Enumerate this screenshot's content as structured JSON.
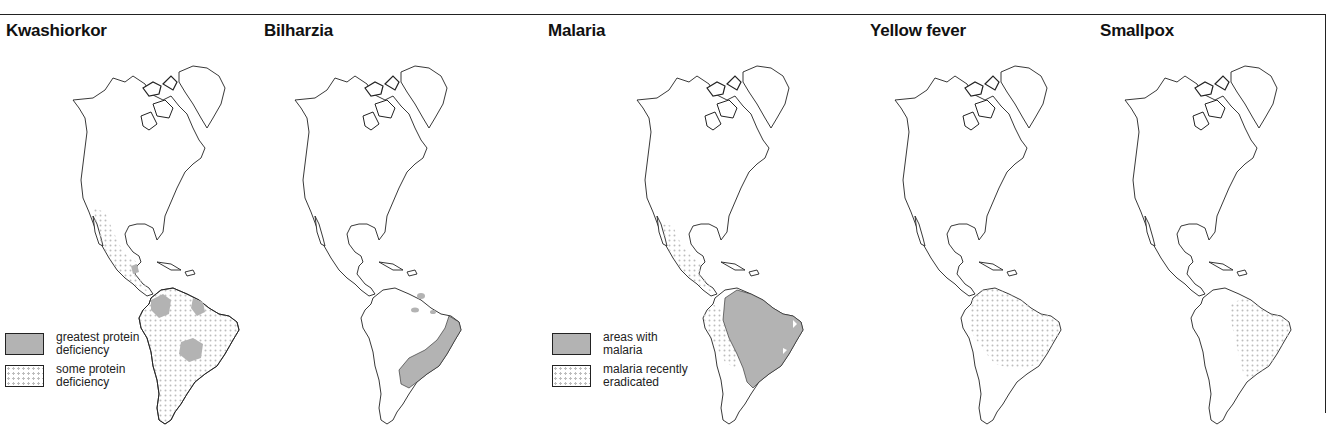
{
  "figure": {
    "colors": {
      "outline": "#222222",
      "dark_fill": "#b3b3b3",
      "dot_fill": "#bdbdbd",
      "background": "#ffffff"
    }
  },
  "panels": [
    {
      "title": "Kwashiorkor",
      "legend": [
        {
          "pattern": "dark",
          "label": "greatest protein deficiency"
        },
        {
          "pattern": "dots",
          "label": "some protein deficiency"
        }
      ]
    },
    {
      "title": "Bilharzia",
      "legend": []
    },
    {
      "title": "Malaria",
      "legend": [
        {
          "pattern": "dark",
          "label": "areas with malaria"
        },
        {
          "pattern": "dots",
          "label": "malaria recently eradicated"
        }
      ]
    },
    {
      "title": "Yellow fever",
      "legend": []
    },
    {
      "title": "Smallpox",
      "legend": []
    }
  ]
}
